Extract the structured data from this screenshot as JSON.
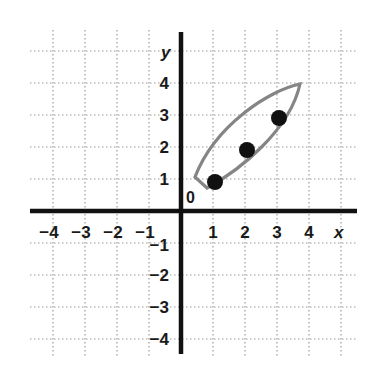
{
  "chart_data": {
    "type": "scatter",
    "title": "",
    "xlabel": "x",
    "ylabel": "y",
    "xlim": [
      -4,
      4
    ],
    "ylim": [
      -4,
      4
    ],
    "grid": true,
    "origin_label": "0",
    "x_ticks": [
      "-4",
      "-3",
      "-2",
      "-1",
      "1",
      "2",
      "3",
      "4"
    ],
    "y_ticks": [
      "4",
      "3",
      "2",
      "1",
      "-1",
      "-2",
      "-3",
      "-4"
    ],
    "series": [
      {
        "name": "points",
        "points": [
          [
            1,
            1
          ],
          [
            2,
            2
          ],
          [
            3,
            3
          ]
        ]
      }
    ],
    "annotations": [
      {
        "type": "enclosing-loop",
        "description": "gray leaf-shaped loop enclosing the three points, tip at (4,4)",
        "color": "#808080"
      }
    ]
  },
  "colors": {
    "axis": "#111111",
    "grid": "#9a9a9a",
    "loop": "#858585",
    "point": "#111111"
  }
}
